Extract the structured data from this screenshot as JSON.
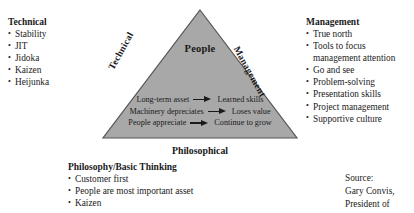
{
  "diagram": {
    "fill_color": "#a8a8a8",
    "edge_color": "#555555",
    "center_label": "People",
    "edges": {
      "left_label": "Technical",
      "right_label": "Management",
      "bottom_label": "Philosophical"
    },
    "relations": [
      {
        "from": "Long-term asset",
        "arrow": "→",
        "to": "Learned skills"
      },
      {
        "from": "Machinery depreciates",
        "arrow": "→",
        "to": "Loses value"
      },
      {
        "from": "People appreciate",
        "arrow": "→",
        "to": "Continue to grow"
      }
    ]
  },
  "technical": {
    "heading": "Technical",
    "items": [
      "Stability",
      "JIT",
      "Jidoka",
      "Kaizen",
      "Heijunka"
    ]
  },
  "management": {
    "heading": "Management",
    "items": [
      {
        "text": "True north",
        "continuation": false
      },
      {
        "text": "Tools to focus",
        "continuation": false
      },
      {
        "text": "management attention",
        "continuation": true
      },
      {
        "text": "Go and see",
        "continuation": false
      },
      {
        "text": "Problem-solving",
        "continuation": false
      },
      {
        "text": "Presentation skills",
        "continuation": false
      },
      {
        "text": "Project management",
        "continuation": false
      },
      {
        "text": "Supportive culture",
        "continuation": false
      }
    ]
  },
  "philosophy": {
    "heading": "Philosophy/Basic Thinking",
    "items": [
      "Customer first",
      "People are most important asset",
      "Kaizen"
    ]
  },
  "source": {
    "lines": [
      "Source:",
      "Gary Convis,",
      "President of"
    ]
  }
}
